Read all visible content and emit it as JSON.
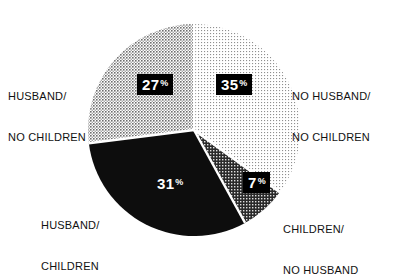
{
  "chart_data": {
    "type": "pie",
    "title": "",
    "subtitle": "",
    "xlabel": "",
    "ylabel": "",
    "legend_position": "outside-labels",
    "grid": false,
    "units": "percent",
    "categories": [
      "NO HUSBAND/ NO CHILDREN",
      "CHILDREN/ NO HUSBAND",
      "HUSBAND/ CHILDREN",
      "HUSBAND/ NO CHILDREN"
    ],
    "values": [
      35,
      7,
      31,
      27
    ],
    "slices": [
      {
        "id": "no-husband-no-children",
        "label_line1": "NO HUSBAND/",
        "label_line2": "NO CHILDREN",
        "value": 35,
        "value_text": "35",
        "percent_symbol": "%",
        "fill_style": "light-dots",
        "fill_color": "#e8e8e8",
        "start_angle_deg": 0,
        "end_angle_deg": 126
      },
      {
        "id": "children-no-husband",
        "label_line1": "CHILDREN/",
        "label_line2": "NO HUSBAND",
        "value": 7,
        "value_text": "7",
        "percent_symbol": "%",
        "fill_style": "dark-crosshatch",
        "fill_color": "#4a4a4a",
        "start_angle_deg": 126,
        "end_angle_deg": 151.2
      },
      {
        "id": "husband-children",
        "label_line1": "HUSBAND/",
        "label_line2": "CHILDREN",
        "value": 31,
        "value_text": "31",
        "percent_symbol": "%",
        "fill_style": "solid-black",
        "fill_color": "#0d0d0d",
        "start_angle_deg": 151.2,
        "end_angle_deg": 262.8
      },
      {
        "id": "husband-no-children",
        "label_line1": "HUSBAND/",
        "label_line2": "NO CHILDREN",
        "value": 27,
        "value_text": "27",
        "percent_symbol": "%",
        "fill_style": "medium-checker",
        "fill_color": "#9a9a9a",
        "start_angle_deg": 262.8,
        "end_angle_deg": 360
      }
    ],
    "colors": {
      "background": "#ffffff",
      "text": "#111111",
      "chip_background": "#000000",
      "chip_text": "#ffffff",
      "slice_separator": "#ffffff"
    }
  }
}
